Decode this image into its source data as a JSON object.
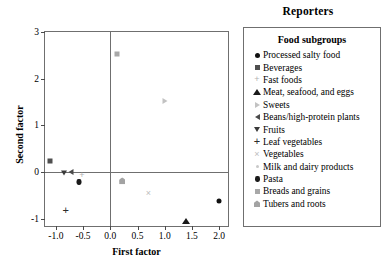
{
  "chart_data": {
    "type": "scatter",
    "title": "Reporters",
    "xlabel": "First factor",
    "ylabel": "Second factor",
    "xlim": [
      -1.2,
      2.2
    ],
    "ylim": [
      -1.2,
      3.0
    ],
    "xticks": [
      "-1.0",
      "-0.5",
      "0.0",
      "0.5",
      "1.0",
      "1.5",
      "2.0"
    ],
    "xtick_values": [
      -1.0,
      -0.5,
      0.0,
      0.5,
      1.0,
      1.5,
      2.0
    ],
    "yticks": [
      "-1",
      "0",
      "1",
      "2",
      "3"
    ],
    "ytick_values": [
      -1,
      0,
      1,
      2,
      3
    ],
    "grid": false,
    "reference_lines": {
      "x": 0.0,
      "y": 0.0
    },
    "legend_position": "right",
    "legend_title": "Food subgroups",
    "points": [
      {
        "label": "Processed salty food",
        "marker": "circle",
        "x": 1.99,
        "y": -0.62
      },
      {
        "label": "Beverages",
        "marker": "square",
        "x": -1.1,
        "y": 0.23
      },
      {
        "label": "Fast foods",
        "marker": "plus-lite",
        "x": -0.52,
        "y": -0.07
      },
      {
        "label": "Meat, seafood, and eggs",
        "marker": "triangle-up",
        "x": 1.4,
        "y": -1.06
      },
      {
        "label": "Sweets",
        "marker": "triangle-right",
        "x": 1.0,
        "y": 1.53
      },
      {
        "label": "Beans/high-protein plants",
        "marker": "triangle-left",
        "x": -0.72,
        "y": -0.01
      },
      {
        "label": "Fruits",
        "marker": "triangle-down",
        "x": -0.85,
        "y": -0.02
      },
      {
        "label": "Leaf vegetables",
        "marker": "plus",
        "x": -0.82,
        "y": -0.82
      },
      {
        "label": "Vegetables",
        "marker": "cross",
        "x": 0.7,
        "y": -0.45
      },
      {
        "label": "Milk and dairy products",
        "marker": "dot-lite",
        "x": 0.2,
        "y": -0.19
      },
      {
        "label": "Pasta",
        "marker": "pasta",
        "x": -0.57,
        "y": -0.22
      },
      {
        "label": "Breads and grains",
        "marker": "square-gray",
        "x": 0.12,
        "y": 2.52
      },
      {
        "label": "Tubers and roots",
        "marker": "tuber",
        "x": 0.22,
        "y": -0.19
      }
    ]
  },
  "legend": {
    "title": "Food subgroups",
    "items": [
      {
        "label": "Processed salty food",
        "marker": "circle"
      },
      {
        "label": "Beverages",
        "marker": "square"
      },
      {
        "label": "Fast foods",
        "marker": "plus-lite"
      },
      {
        "label": "Meat, seafood, and eggs",
        "marker": "triangle-up"
      },
      {
        "label": "Sweets",
        "marker": "triangle-right"
      },
      {
        "label": "Beans/high-protein plants",
        "marker": "triangle-left"
      },
      {
        "label": "Fruits",
        "marker": "triangle-down"
      },
      {
        "label": "Leaf vegetables",
        "marker": "plus"
      },
      {
        "label": "Vegetables",
        "marker": "cross"
      },
      {
        "label": "Milk and dairy products",
        "marker": "dot-lite"
      },
      {
        "label": "Pasta",
        "marker": "pasta"
      },
      {
        "label": "Breads and grains",
        "marker": "square-gray"
      },
      {
        "label": "Tubers and roots",
        "marker": "tuber"
      }
    ]
  },
  "colors": {
    "frame": "#6f6f6f",
    "text": "#000000",
    "marker_dark": "#111111",
    "marker_mid": "#4f4f4f",
    "marker_light": "#b9b9b9"
  }
}
